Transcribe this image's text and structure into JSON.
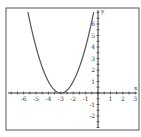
{
  "chart_data": {
    "type": "line",
    "title": "",
    "function": "y = (x+3)^2",
    "xlabel": "x",
    "ylabel": "y",
    "xlim": [
      -7,
      3
    ],
    "ylim": [
      -3,
      7
    ],
    "xticks": [
      -6,
      -5,
      -4,
      -3,
      -2,
      -1,
      1,
      2,
      3
    ],
    "yticks": [
      -2,
      -1,
      1,
      2,
      3,
      4,
      5,
      6
    ],
    "grid": false,
    "series": [
      {
        "name": "y=(x+3)^2",
        "x": [
          -5.65,
          -5,
          -4,
          -3,
          -2,
          -1,
          -0.35
        ],
        "y": [
          7,
          4,
          1,
          0,
          1,
          4,
          7
        ]
      }
    ],
    "vertex": [
      -3,
      0
    ]
  },
  "colors": {
    "curve": "#555555",
    "axis": "#333333",
    "frame": "#444444",
    "background": "#ffffff"
  }
}
